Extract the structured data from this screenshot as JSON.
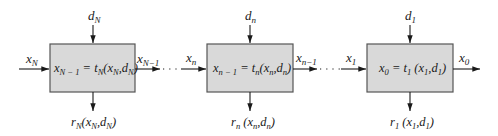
{
  "diagram": {
    "type": "serial multistage decision process",
    "stages": [
      {
        "id": "stage-N",
        "decision": "d_N",
        "input": "x_N",
        "output": "x_{N-1}",
        "transform": "x_{N-1} = t_N(x_N, d_N)",
        "return": "r_N(x_N, d_N)"
      },
      {
        "id": "stage-n",
        "decision": "d_n",
        "input": "x_n",
        "output": "x_{n-1}",
        "transform": "x_{n-1} = t_n(x_n, d_n)",
        "return": "r_n(x_n, d_n)"
      },
      {
        "id": "stage-1",
        "decision": "d_1",
        "input": "x_1",
        "output": "x_0",
        "transform": "x_0 = t_1(x_1, d_1)",
        "return": "r_1(x_1, d_1)"
      }
    ],
    "connectors": [
      {
        "from": "stage-N",
        "to": "stage-n",
        "style": "dotted (ellipsis)"
      },
      {
        "from": "stage-n",
        "to": "stage-1",
        "style": "dotted (ellipsis)"
      }
    ],
    "colors": {
      "box_fill": "#d9d9d9",
      "box_stroke": "#555555",
      "ink": "#1a1a1a"
    }
  }
}
